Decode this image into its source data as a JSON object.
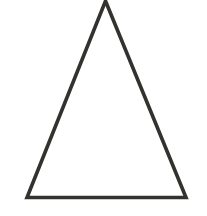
{
  "canvas": {
    "width": 207,
    "height": 216,
    "background_color": "#ffffff"
  },
  "figure": {
    "name": "triangle",
    "kind": "isosceles-triangle",
    "label": "",
    "stroke_color": "#33322f",
    "stroke_width": 3.6,
    "fill": "none",
    "vertices": [
      {
        "name": "apex",
        "x": 105.5,
        "y": 1.0
      },
      {
        "name": "bottom-right",
        "x": 186.0,
        "y": 197.5
      },
      {
        "name": "bottom-left",
        "x": 27.0,
        "y": 197.5
      }
    ],
    "points_attr": "105.5,1.0 186.0,197.5 27.0,197.5",
    "base_width": 159,
    "height": 196.5
  },
  "chart_data": {
    "type": "scatter",
    "title": "",
    "xlabel": "",
    "ylabel": "",
    "xlim": [
      0,
      207
    ],
    "ylim": [
      216,
      0
    ],
    "grid": false,
    "legend": null,
    "series": [
      {
        "name": "triangle-outline",
        "closed": true,
        "x": [
          105.5,
          186.0,
          27.0
        ],
        "y": [
          1.0,
          197.5,
          197.5
        ]
      }
    ],
    "annotations": []
  }
}
